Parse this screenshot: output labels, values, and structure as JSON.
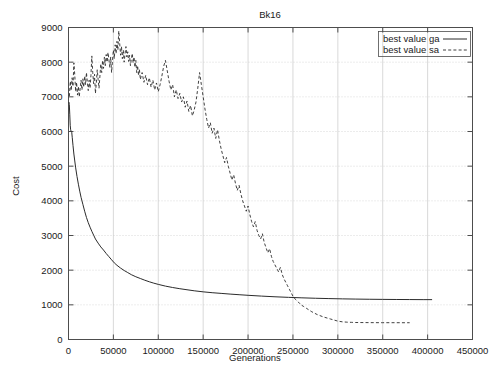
{
  "chart_data": {
    "type": "line",
    "title": "Bk16",
    "xlabel": "Generations",
    "ylabel": "Cost",
    "xlim": [
      0,
      450000
    ],
    "ylim": [
      0,
      9000
    ],
    "xticks": [
      0,
      50000,
      100000,
      150000,
      200000,
      250000,
      300000,
      350000,
      400000,
      450000
    ],
    "xtick_labels": [
      "0",
      "50000",
      "100000",
      "150000",
      "200000",
      "250000",
      "300000",
      "350000",
      "400000",
      "450000"
    ],
    "yticks": [
      0,
      1000,
      2000,
      3000,
      4000,
      5000,
      6000,
      7000,
      8000,
      9000
    ],
    "ytick_labels": [
      "0",
      "1000",
      "2000",
      "3000",
      "4000",
      "5000",
      "6000",
      "7000",
      "8000",
      "9000"
    ],
    "grid": true,
    "legend_position": "top-right",
    "series": [
      {
        "name": "best value ga",
        "style": "solid",
        "color": "#2b2b2b",
        "points": [
          [
            500,
            6850
          ],
          [
            900,
            6780
          ],
          [
            1400,
            6500
          ],
          [
            1900,
            6180
          ],
          [
            2400,
            6050
          ],
          [
            3000,
            6000
          ],
          [
            3600,
            5980
          ],
          [
            4200,
            5820
          ],
          [
            5000,
            5600
          ],
          [
            6000,
            5350
          ],
          [
            7000,
            5150
          ],
          [
            8000,
            4950
          ],
          [
            9500,
            4700
          ],
          [
            11000,
            4480
          ],
          [
            12500,
            4280
          ],
          [
            14000,
            4100
          ],
          [
            16000,
            3900
          ],
          [
            18000,
            3700
          ],
          [
            20000,
            3520
          ],
          [
            22000,
            3370
          ],
          [
            24000,
            3240
          ],
          [
            26000,
            3120
          ],
          [
            28000,
            3010
          ],
          [
            30000,
            2900
          ],
          [
            33000,
            2780
          ],
          [
            36000,
            2670
          ],
          [
            39000,
            2580
          ],
          [
            42000,
            2480
          ],
          [
            45000,
            2390
          ],
          [
            48000,
            2300
          ],
          [
            51000,
            2210
          ],
          [
            54000,
            2140
          ],
          [
            58000,
            2060
          ],
          [
            62000,
            1990
          ],
          [
            66000,
            1930
          ],
          [
            70000,
            1870
          ],
          [
            75000,
            1810
          ],
          [
            80000,
            1760
          ],
          [
            85000,
            1710
          ],
          [
            90000,
            1665
          ],
          [
            95000,
            1625
          ],
          [
            100000,
            1590
          ],
          [
            108000,
            1540
          ],
          [
            116000,
            1500
          ],
          [
            124000,
            1465
          ],
          [
            132000,
            1435
          ],
          [
            140000,
            1405
          ],
          [
            150000,
            1375
          ],
          [
            160000,
            1350
          ],
          [
            170000,
            1330
          ],
          [
            180000,
            1310
          ],
          [
            190000,
            1292
          ],
          [
            200000,
            1275
          ],
          [
            215000,
            1252
          ],
          [
            230000,
            1232
          ],
          [
            245000,
            1216
          ],
          [
            260000,
            1202
          ],
          [
            275000,
            1190
          ],
          [
            290000,
            1180
          ],
          [
            305000,
            1172
          ],
          [
            320000,
            1166
          ],
          [
            335000,
            1161
          ],
          [
            350000,
            1157
          ],
          [
            365000,
            1154
          ],
          [
            380000,
            1152
          ],
          [
            395000,
            1150
          ],
          [
            405000,
            1150
          ]
        ]
      },
      {
        "name": "best value sa",
        "style": "dashed",
        "color": "#2b2b2b",
        "points": [
          [
            1000,
            7020
          ],
          [
            2000,
            7450
          ],
          [
            3000,
            7180
          ],
          [
            4000,
            7550
          ],
          [
            5000,
            7300
          ],
          [
            6000,
            7980
          ],
          [
            7000,
            7620
          ],
          [
            8000,
            7150
          ],
          [
            9000,
            7420
          ],
          [
            10000,
            7050
          ],
          [
            11000,
            7300
          ],
          [
            12000,
            7000
          ],
          [
            13000,
            7250
          ],
          [
            14000,
            7480
          ],
          [
            15000,
            7200
          ],
          [
            16000,
            7520
          ],
          [
            17000,
            7280
          ],
          [
            18000,
            7600
          ],
          [
            19000,
            7350
          ],
          [
            20000,
            7700
          ],
          [
            21000,
            7420
          ],
          [
            22000,
            7180
          ],
          [
            23000,
            7480
          ],
          [
            24000,
            7250
          ],
          [
            25000,
            7620
          ],
          [
            26000,
            8180
          ],
          [
            27000,
            7700
          ],
          [
            28000,
            7380
          ],
          [
            29000,
            7650
          ],
          [
            30000,
            7100
          ],
          [
            31000,
            7400
          ],
          [
            32000,
            7780
          ],
          [
            33000,
            7500
          ],
          [
            34000,
            7250
          ],
          [
            35000,
            7600
          ],
          [
            36000,
            7950
          ],
          [
            37000,
            7700
          ],
          [
            38000,
            8050
          ],
          [
            39000,
            7820
          ],
          [
            40000,
            8150
          ],
          [
            41000,
            7900
          ],
          [
            42000,
            8220
          ],
          [
            43000,
            8000
          ],
          [
            44000,
            8280
          ],
          [
            45000,
            8080
          ],
          [
            46000,
            7850
          ],
          [
            47000,
            8150
          ],
          [
            48000,
            7700
          ],
          [
            49000,
            8050
          ],
          [
            50000,
            8350
          ],
          [
            51000,
            8100
          ],
          [
            52000,
            8500
          ],
          [
            53000,
            8250
          ],
          [
            54000,
            8600
          ],
          [
            55000,
            8350
          ],
          [
            56000,
            8900
          ],
          [
            57000,
            8550
          ],
          [
            58000,
            8200
          ],
          [
            59000,
            8450
          ],
          [
            60000,
            8100
          ],
          [
            61000,
            8350
          ],
          [
            62000,
            8000
          ],
          [
            63000,
            8250
          ],
          [
            64000,
            8450
          ],
          [
            65000,
            8150
          ],
          [
            66000,
            8300
          ],
          [
            67000,
            8020
          ],
          [
            68000,
            8200
          ],
          [
            69000,
            7900
          ],
          [
            70000,
            8100
          ],
          [
            71000,
            8250
          ],
          [
            72000,
            7980
          ],
          [
            73000,
            8150
          ],
          [
            74000,
            7850
          ],
          [
            75000,
            8050
          ],
          [
            76000,
            7700
          ],
          [
            77000,
            7900
          ],
          [
            78000,
            7620
          ],
          [
            79000,
            7800
          ],
          [
            80000,
            7500
          ],
          [
            82000,
            7700
          ],
          [
            84000,
            7420
          ],
          [
            86000,
            7620
          ],
          [
            88000,
            7350
          ],
          [
            90000,
            7550
          ],
          [
            92000,
            7280
          ],
          [
            94000,
            7480
          ],
          [
            96000,
            7200
          ],
          [
            98000,
            7400
          ],
          [
            100000,
            7150
          ],
          [
            102000,
            7350
          ],
          [
            104000,
            7600
          ],
          [
            106000,
            7880
          ],
          [
            108000,
            8050
          ],
          [
            110000,
            7750
          ],
          [
            112000,
            7450
          ],
          [
            114000,
            7200
          ],
          [
            116000,
            7350
          ],
          [
            118000,
            7000
          ],
          [
            120000,
            7200
          ],
          [
            122000,
            6950
          ],
          [
            124000,
            7100
          ],
          [
            126000,
            6850
          ],
          [
            128000,
            7000
          ],
          [
            130000,
            6700
          ],
          [
            132000,
            6880
          ],
          [
            134000,
            6580
          ],
          [
            136000,
            6750
          ],
          [
            138000,
            6450
          ],
          [
            140000,
            6620
          ],
          [
            142000,
            6850
          ],
          [
            144000,
            7250
          ],
          [
            146000,
            7700
          ],
          [
            148000,
            7350
          ],
          [
            150000,
            7000
          ],
          [
            152000,
            6650
          ],
          [
            154000,
            6350
          ],
          [
            156000,
            6100
          ],
          [
            158000,
            6250
          ],
          [
            160000,
            5950
          ],
          [
            162000,
            6100
          ],
          [
            164000,
            5800
          ],
          [
            166000,
            6050
          ],
          [
            168000,
            5750
          ],
          [
            170000,
            5500
          ],
          [
            172000,
            5300
          ],
          [
            174000,
            5100
          ],
          [
            176000,
            5250
          ],
          [
            178000,
            5000
          ],
          [
            180000,
            4800
          ],
          [
            182000,
            4600
          ],
          [
            184000,
            4750
          ],
          [
            186000,
            4500
          ],
          [
            188000,
            4300
          ],
          [
            190000,
            4450
          ],
          [
            192000,
            4200
          ],
          [
            194000,
            4000
          ],
          [
            196000,
            3850
          ],
          [
            198000,
            3700
          ],
          [
            200000,
            3850
          ],
          [
            202000,
            3600
          ],
          [
            204000,
            3400
          ],
          [
            206000,
            3250
          ],
          [
            208000,
            3400
          ],
          [
            210000,
            3150
          ],
          [
            212000,
            3000
          ],
          [
            214000,
            2900
          ],
          [
            216000,
            3050
          ],
          [
            218000,
            2800
          ],
          [
            220000,
            2650
          ],
          [
            222000,
            2500
          ],
          [
            224000,
            2620
          ],
          [
            226000,
            2400
          ],
          [
            228000,
            2250
          ],
          [
            230000,
            2150
          ],
          [
            232000,
            2050
          ],
          [
            234000,
            1950
          ],
          [
            236000,
            2080
          ],
          [
            238000,
            1880
          ],
          [
            240000,
            1750
          ],
          [
            242000,
            1650
          ],
          [
            244000,
            1550
          ],
          [
            246000,
            1450
          ],
          [
            248000,
            1350
          ],
          [
            250000,
            1250
          ],
          [
            253000,
            1150
          ],
          [
            256000,
            1080
          ],
          [
            259000,
            1000
          ],
          [
            262000,
            950
          ],
          [
            265000,
            900
          ],
          [
            268000,
            850
          ],
          [
            271000,
            800
          ],
          [
            274000,
            760
          ],
          [
            277000,
            720
          ],
          [
            280000,
            690
          ],
          [
            284000,
            650
          ],
          [
            288000,
            620
          ],
          [
            292000,
            590
          ],
          [
            296000,
            560
          ],
          [
            300000,
            530
          ],
          [
            305000,
            510
          ],
          [
            310000,
            500
          ],
          [
            315000,
            495
          ],
          [
            320000,
            490
          ],
          [
            330000,
            488
          ],
          [
            340000,
            486
          ],
          [
            350000,
            485
          ],
          [
            360000,
            485
          ],
          [
            370000,
            484
          ],
          [
            380000,
            484
          ]
        ]
      }
    ]
  },
  "colors": {
    "axis": "#4d4d4d",
    "grid": "#c8c8c8",
    "series": "#2b2b2b",
    "background": "#ffffff"
  }
}
